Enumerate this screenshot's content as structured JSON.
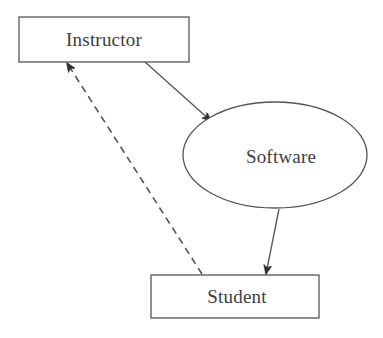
{
  "diagram": {
    "type": "flow-diagram",
    "background_color": "#ffffff",
    "stroke_color": "#555555",
    "text_color": "#3d3d3d",
    "nodes": [
      {
        "id": "instructor",
        "label": "Instructor",
        "shape": "rectangle",
        "x": 19,
        "y": 17,
        "width": 170,
        "height": 45,
        "label_x": 104,
        "label_y": 46
      },
      {
        "id": "software",
        "label": "Software",
        "shape": "ellipse",
        "cx": 275,
        "cy": 155,
        "rx": 92,
        "ry": 53,
        "label_x": 281,
        "label_y": 163
      },
      {
        "id": "student",
        "label": "Student",
        "shape": "rectangle",
        "x": 151,
        "y": 275,
        "width": 168,
        "height": 43,
        "label_x": 237,
        "label_y": 303
      }
    ],
    "edges": [
      {
        "id": "instructor-to-software",
        "from": "instructor",
        "to": "software",
        "style": "solid",
        "arrow": "end",
        "x1": 145,
        "y1": 62,
        "x2": 211,
        "y2": 121
      },
      {
        "id": "software-to-student",
        "from": "software",
        "to": "student",
        "style": "solid",
        "arrow": "end",
        "x1": 279,
        "y1": 209,
        "x2": 266,
        "y2": 274
      },
      {
        "id": "student-to-instructor",
        "from": "student",
        "to": "instructor",
        "style": "dashed",
        "arrow": "end",
        "x1": 202,
        "y1": 274,
        "x2": 67,
        "y2": 63,
        "dash_pattern": "7 5"
      }
    ]
  }
}
